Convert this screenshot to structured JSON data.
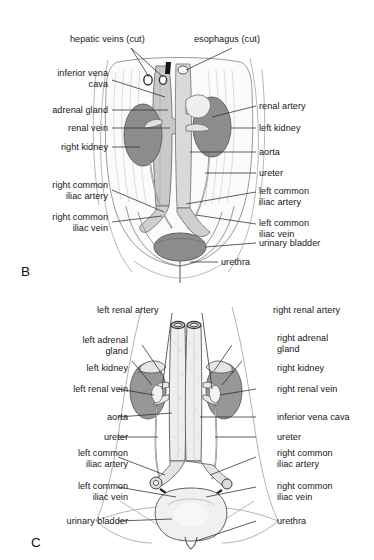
{
  "figure": {
    "background_color": "#ffffff",
    "ink_color": "#1a1a1a",
    "leader_line_color": "#2b2b2b",
    "kidney_fill": "#8f8f8f",
    "vessel_fill": "#d6d6d6",
    "bladder_fill": "#9a9a9a",
    "outline_color": "#6e6e6e"
  },
  "panel_b": {
    "letter": "B",
    "labels_left": [
      {
        "id": "hepatic-veins-cut",
        "text": "hepatic veins (cut)",
        "align": "left"
      },
      {
        "id": "inferior-vena-cava",
        "text": "inferior vena\ncava",
        "align": "right"
      },
      {
        "id": "adrenal-gland",
        "text": "adrenal gland",
        "align": "right"
      },
      {
        "id": "renal-vein",
        "text": "renal vein",
        "align": "right"
      },
      {
        "id": "right-kidney",
        "text": "right kidney",
        "align": "right"
      },
      {
        "id": "right-common-iliac-artery",
        "text": "right common\niliac artery",
        "align": "right"
      },
      {
        "id": "right-common-iliac-vein",
        "text": "right common\niliac vein",
        "align": "right"
      }
    ],
    "labels_right": [
      {
        "id": "esophagus-cut",
        "text": "esophagus (cut)",
        "align": "left"
      },
      {
        "id": "renal-artery",
        "text": "renal artery",
        "align": "left"
      },
      {
        "id": "left-kidney",
        "text": "left kidney",
        "align": "left"
      },
      {
        "id": "aorta",
        "text": "aorta",
        "align": "left"
      },
      {
        "id": "ureter",
        "text": "ureter",
        "align": "left"
      },
      {
        "id": "left-common-iliac-artery",
        "text": "left common\niliac artery",
        "align": "left"
      },
      {
        "id": "left-common-iliac-vein",
        "text": "left common\niliac vein",
        "align": "left"
      },
      {
        "id": "urinary-bladder",
        "text": "urinary bladder",
        "align": "left"
      },
      {
        "id": "urethra",
        "text": "urethra",
        "align": "left"
      }
    ]
  },
  "panel_c": {
    "letter": "C",
    "labels_left": [
      {
        "id": "left-renal-artery",
        "text": "left renal artery",
        "align": "left"
      },
      {
        "id": "left-adrenal-gland",
        "text": "left adrenal\ngland",
        "align": "right"
      },
      {
        "id": "left-kidney",
        "text": "left kidney",
        "align": "right"
      },
      {
        "id": "left-renal-vein",
        "text": "left renal vein",
        "align": "right"
      },
      {
        "id": "aorta",
        "text": "aorta",
        "align": "right"
      },
      {
        "id": "ureter",
        "text": "ureter",
        "align": "right"
      },
      {
        "id": "left-common-iliac-artery",
        "text": "left common\niliac artery",
        "align": "right"
      },
      {
        "id": "left-common-iliac-vein",
        "text": "left common\niliac vein",
        "align": "right"
      },
      {
        "id": "urinary-bladder",
        "text": "urinary bladder",
        "align": "right"
      }
    ],
    "labels_right": [
      {
        "id": "right-renal-artery",
        "text": "right renal artery",
        "align": "left"
      },
      {
        "id": "right-adrenal-gland",
        "text": "right adrenal\ngland",
        "align": "left"
      },
      {
        "id": "right-kidney",
        "text": "right kidney",
        "align": "left"
      },
      {
        "id": "right-renal-vein",
        "text": "right renal vein",
        "align": "left"
      },
      {
        "id": "inferior-vena-cava",
        "text": "inferior vena cava",
        "align": "left"
      },
      {
        "id": "ureter",
        "text": "ureter",
        "align": "left"
      },
      {
        "id": "right-common-iliac-artery",
        "text": "right common\niliac artery",
        "align": "left"
      },
      {
        "id": "right-common-iliac-vein",
        "text": "right common\niliac vein",
        "align": "left"
      },
      {
        "id": "urethra",
        "text": "urethra",
        "align": "left"
      }
    ]
  }
}
